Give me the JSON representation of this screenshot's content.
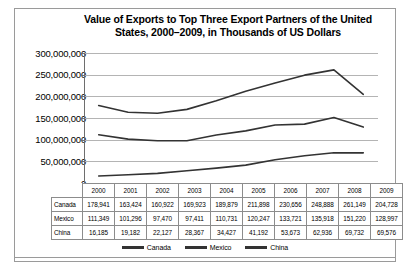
{
  "chart_data": {
    "type": "line",
    "title": "Value of Exports to Top Three Export Partners of the United States, 2000–2009, in Thousands of US Dollars",
    "title_line1": "Value of Exports to Top Three Export Partners of the United",
    "title_line2": "States, 2000–2009, in Thousands of US Dollars",
    "xlabel": "",
    "ylabel": "",
    "categories": [
      "2000",
      "2001",
      "2002",
      "2003",
      "2004",
      "2005",
      "2006",
      "2007",
      "2008",
      "2009"
    ],
    "series": [
      {
        "name": "Canada",
        "values": [
          178941,
          163424,
          160922,
          169923,
          189879,
          211898,
          230656,
          248888,
          261149,
          204728
        ],
        "labels": [
          "178,941",
          "163,424",
          "160,922",
          "169,923",
          "189,879",
          "211,898",
          "230,656",
          "248,888",
          "261,149",
          "204,728"
        ],
        "color": "#333333"
      },
      {
        "name": "Mexico",
        "values": [
          111349,
          101296,
          97470,
          97411,
          110731,
          120247,
          133721,
          135918,
          151220,
          128997
        ],
        "labels": [
          "111,349",
          "101,296",
          "97,470",
          "97,411",
          "110,731",
          "120,247",
          "133,721",
          "135,918",
          "151,220",
          "128,997"
        ],
        "color": "#333333"
      },
      {
        "name": "China",
        "values": [
          16185,
          19182,
          22127,
          28367,
          34427,
          41192,
          53673,
          62936,
          69732,
          69576
        ],
        "labels": [
          "16,185",
          "19,182",
          "22,127",
          "28,367",
          "34,427",
          "41,192",
          "53,673",
          "62,936",
          "69,732",
          "69,576"
        ],
        "color": "#333333"
      }
    ],
    "ylim": [
      0,
      300000000
    ],
    "ytick_values": [
      300000000,
      250000000,
      200000000,
      150000000,
      100000000,
      50000000,
      0
    ],
    "ytick_labels": [
      "300,000,000",
      "250,000,000",
      "200,000,000",
      "150,000,000",
      "100,000,000",
      "50,000,000",
      "0"
    ],
    "value_scale_multiplier": 1000,
    "grid": true,
    "legend_position": "bottom",
    "legend_entries": [
      "Canada",
      "Mexico",
      "China"
    ]
  },
  "table": {
    "row_header_blank": "",
    "column_headers": [
      "2000",
      "2001",
      "2002",
      "2003",
      "2004",
      "2005",
      "2006",
      "2007",
      "2008",
      "2009"
    ],
    "rows": [
      {
        "label": "Canada",
        "cells": [
          "178,941",
          "163,424",
          "160,922",
          "169,923",
          "189,879",
          "211,898",
          "230,656",
          "248,888",
          "261,149",
          "204,728"
        ]
      },
      {
        "label": "Mexico",
        "cells": [
          "111,349",
          "101,296",
          "97,470",
          "97,411",
          "110,731",
          "120,247",
          "133,721",
          "135,918",
          "151,220",
          "128,997"
        ]
      },
      {
        "label": "China",
        "cells": [
          "16,185",
          "19,182",
          "22,127",
          "28,367",
          "34,427",
          "41,192",
          "53,673",
          "62,936",
          "69,732",
          "69,576"
        ]
      }
    ]
  }
}
